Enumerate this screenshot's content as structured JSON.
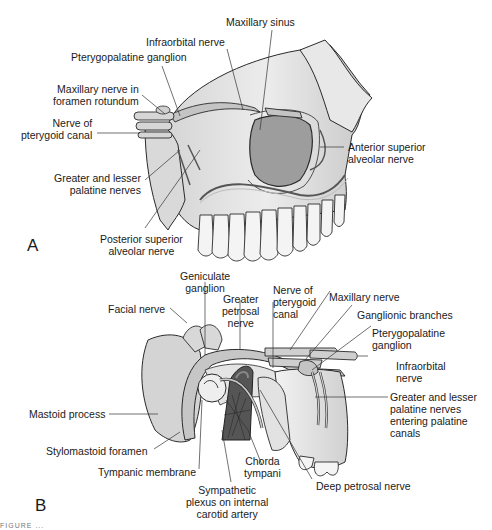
{
  "figure": {
    "panels": [
      {
        "id": "A",
        "letter": "A",
        "title": "Maxillary nerve and branches (lateral view of maxilla)",
        "labels": [
          {
            "key": "maxillary_sinus",
            "lines": [
              "Maxillary sinus"
            ]
          },
          {
            "key": "infraorbital_nerve",
            "lines": [
              "Infraorbital nerve"
            ]
          },
          {
            "key": "pterygopalatine_ganglion",
            "lines": [
              "Pterygopalatine ganglion"
            ]
          },
          {
            "key": "maxillary_nerve_foramen",
            "lines": [
              "Maxillary nerve in",
              "foramen rotundum"
            ]
          },
          {
            "key": "nerve_pterygoid_canal",
            "lines": [
              "Nerve of",
              "pterygoid canal"
            ]
          },
          {
            "key": "anterior_superior_alveolar",
            "lines": [
              "Anterior superior",
              "alveolar nerve"
            ]
          },
          {
            "key": "greater_lesser_palatine",
            "lines": [
              "Greater and lesser",
              "palatine nerves"
            ]
          },
          {
            "key": "posterior_superior_alveolar",
            "lines": [
              "Posterior superior",
              "alveolar nerve"
            ]
          }
        ]
      },
      {
        "id": "B",
        "letter": "B",
        "title": "Facial nerve, greater petrosal nerve and pterygopalatine ganglion",
        "labels": [
          {
            "key": "geniculate_ganglion",
            "lines": [
              "Geniculate",
              "ganglion"
            ]
          },
          {
            "key": "greater_petrosal_nerve",
            "lines": [
              "Greater",
              "petrosal",
              "nerve"
            ]
          },
          {
            "key": "nerve_pterygoid_canal_b",
            "lines": [
              "Nerve of",
              "pterygoid",
              "canal"
            ]
          },
          {
            "key": "maxillary_nerve",
            "lines": [
              "Maxillary nerve"
            ]
          },
          {
            "key": "facial_nerve",
            "lines": [
              "Facial nerve"
            ]
          },
          {
            "key": "ganglionic_branches",
            "lines": [
              "Ganglionic branches"
            ]
          },
          {
            "key": "pterygopalatine_ganglion_b",
            "lines": [
              "Pterygopalatine",
              "ganglion"
            ]
          },
          {
            "key": "infraorbital_nerve_b",
            "lines": [
              "Infraorbital",
              "nerve"
            ]
          },
          {
            "key": "greater_lesser_palatine_b",
            "lines": [
              "Greater and lesser",
              "palatine nerves",
              "entering palatine",
              "canals"
            ]
          },
          {
            "key": "mastoid_process",
            "lines": [
              "Mastoid process"
            ]
          },
          {
            "key": "stylomastoid_foramen",
            "lines": [
              "Stylomastoid foramen"
            ]
          },
          {
            "key": "tympanic_membrane",
            "lines": [
              "Tympanic membrane"
            ]
          },
          {
            "key": "chorda_tympani",
            "lines": [
              "Chorda",
              "tympani"
            ]
          },
          {
            "key": "deep_petrosal_nerve",
            "lines": [
              "Deep petrosal nerve"
            ]
          },
          {
            "key": "sympathetic_plexus",
            "lines": [
              "Sympathetic",
              "plexus on internal",
              "carotid artery"
            ]
          }
        ]
      }
    ],
    "caption_fragment": "FIGURE ..."
  },
  "colors": {
    "bone": "#e6e6e6",
    "bone_shade": "#cfcfcf",
    "sinus": "#9a9a9a",
    "nerve": "#bdbdbd",
    "outline": "#2a2a2a",
    "artery": "#5a5a5a",
    "leader": "#333333"
  }
}
